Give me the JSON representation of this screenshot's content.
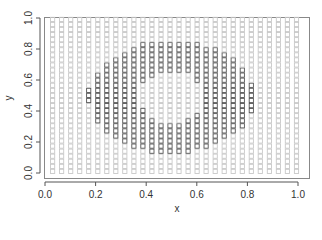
{
  "chart_data": {
    "type": "scatter",
    "title": "",
    "xlabel": "x",
    "ylabel": "y",
    "xlim": [
      0.0,
      1.0
    ],
    "ylim": [
      0.0,
      1.0
    ],
    "x_ticks": [
      "0.0",
      "0.2",
      "0.4",
      "0.6",
      "0.8",
      "1.0"
    ],
    "y_ticks": [
      "0.0",
      "0.2",
      "0.4",
      "0.6",
      "0.8",
      "1.0"
    ],
    "grid": false,
    "legend": null,
    "marker": "open-square",
    "point_grid": {
      "x_start": 0.03,
      "x_step": 0.0357,
      "x_count": 28,
      "y_start": 0.01,
      "y_step": 0.0327,
      "y_count": 31
    },
    "series": [
      {
        "name": "background",
        "color": "#c8c8c8",
        "description": "regular grid of points covering the unit square"
      },
      {
        "name": "ring",
        "color": "#555555",
        "description": "points forming an annulus centred near (0.5, 0.5)",
        "center": [
          0.5,
          0.49
        ],
        "outer_radius": [
          0.33,
          0.36
        ],
        "inner_radius": [
          0.13,
          0.17
        ]
      }
    ]
  }
}
